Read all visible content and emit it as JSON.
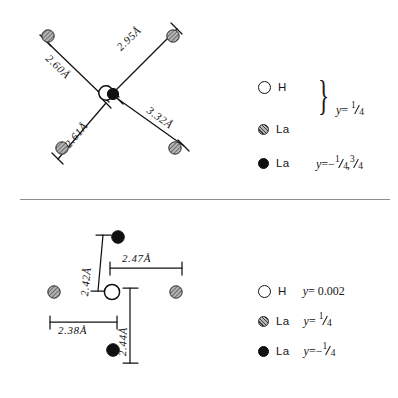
{
  "figure": {
    "divider": {
      "name": "panel-divider"
    }
  },
  "top_panel": {
    "name": "top-structure-diagram",
    "distances": [
      {
        "label": "2.95Å",
        "value": 2.95,
        "unit": "Å",
        "direction": "upper-right"
      },
      {
        "label": "2.60Å",
        "value": 2.6,
        "unit": "Å",
        "direction": "upper-left"
      },
      {
        "label": "3.32Å",
        "value": 3.32,
        "unit": "Å",
        "direction": "lower-right"
      },
      {
        "label": "2.61Å",
        "value": 2.61,
        "unit": "Å",
        "direction": "lower-left"
      }
    ],
    "atoms": [
      {
        "species": "La",
        "style": "hatched",
        "position": "upper-left"
      },
      {
        "species": "La",
        "style": "hatched",
        "position": "upper-right"
      },
      {
        "species": "La",
        "style": "hatched",
        "position": "lower-left"
      },
      {
        "species": "La",
        "style": "hatched",
        "position": "lower-right"
      },
      {
        "species": "H",
        "style": "open",
        "position": "center"
      },
      {
        "species": "La",
        "style": "filled",
        "position": "center"
      }
    ]
  },
  "bottom_panel": {
    "name": "bottom-structure-diagram",
    "distances": [
      {
        "label": "2.42Å",
        "value": 2.42,
        "unit": "Å",
        "direction": "up"
      },
      {
        "label": "2.47Å",
        "value": 2.47,
        "unit": "Å",
        "direction": "right"
      },
      {
        "label": "2.38Å",
        "value": 2.38,
        "unit": "Å",
        "direction": "left"
      },
      {
        "label": "2.44Å",
        "value": 2.44,
        "unit": "Å",
        "direction": "down"
      }
    ],
    "atoms": [
      {
        "species": "La",
        "style": "filled",
        "position": "top"
      },
      {
        "species": "La",
        "style": "filled",
        "position": "bottom"
      },
      {
        "species": "La",
        "style": "hatched",
        "position": "left"
      },
      {
        "species": "La",
        "style": "hatched",
        "position": "right"
      },
      {
        "species": "H",
        "style": "open",
        "position": "center"
      }
    ]
  },
  "legend_top": {
    "name": "top-legend",
    "rows": [
      {
        "symbol": "open-circle",
        "species": "H"
      },
      {
        "symbol": "hatched-circle",
        "species": "La"
      },
      {
        "symbol": "filled-circle",
        "species": "La"
      }
    ],
    "braced_y": {
      "var": "y",
      "eq": "=",
      "value": "¼",
      "num": "1",
      "den": "4"
    },
    "filled_y": {
      "var": "y",
      "eq": "=",
      "value": "-¼, ¾",
      "minus": "−",
      "num1": "1",
      "den1": "4",
      "sep": ",",
      "num2": "3",
      "den2": "4"
    }
  },
  "legend_bottom": {
    "name": "bottom-legend",
    "rows": [
      {
        "symbol": "open-circle",
        "species": "H",
        "y": "y = 0.002",
        "y_var": "y",
        "y_eq": "=",
        "y_val": "0.002"
      },
      {
        "symbol": "hatched-circle",
        "species": "La",
        "y": "y = ¼",
        "y_var": "y",
        "y_eq": "=",
        "num": "1",
        "den": "4"
      },
      {
        "symbol": "filled-circle",
        "species": "La",
        "y": "y = -¼",
        "y_var": "y",
        "y_eq": "=",
        "minus": "−",
        "num": "1",
        "den": "4"
      }
    ]
  },
  "colors": {
    "ink": "#111111",
    "divider": "#8d8d8d",
    "hatch": "#3a3a3a",
    "background": "#ffffff"
  }
}
